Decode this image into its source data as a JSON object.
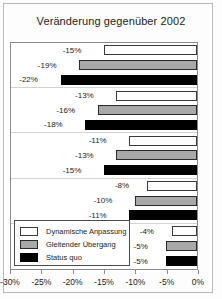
{
  "chart_data": {
    "type": "bar",
    "orientation": "horizontal",
    "title": "Veränderung gegenüber 2002",
    "xlabel": "",
    "ylabel": "",
    "xlim": [
      -30,
      0
    ],
    "xticks": [
      -30,
      -25,
      -20,
      -15,
      -10,
      -5,
      0
    ],
    "xtick_labels": [
      "-30%",
      "-25%",
      "-20%",
      "-15%",
      "-10%",
      "-5%",
      "0%"
    ],
    "grid": false,
    "legend_position": "lower left",
    "categories": [
      "1",
      "2",
      "3",
      "4",
      "5"
    ],
    "series": [
      {
        "name": "Dynamische Anpassung",
        "color": "#ffffff",
        "values": [
          -15,
          -13,
          -11,
          -8,
          -4
        ],
        "labels": [
          "-15%",
          "-13%",
          "-11%",
          "-8%",
          "-4%"
        ]
      },
      {
        "name": "Gleitender Übergang",
        "color": "#a8a8a8",
        "values": [
          -19,
          -16,
          -13,
          -10,
          -5
        ],
        "labels": [
          "-19%",
          "-16%",
          "-13%",
          "-10%",
          "-5%"
        ]
      },
      {
        "name": "Status quo",
        "color": "#000000",
        "values": [
          -22,
          -18,
          -15,
          -11,
          -5
        ],
        "labels": [
          "-22%",
          "-18%",
          "-15%",
          "-11%",
          "-5%"
        ]
      }
    ]
  }
}
